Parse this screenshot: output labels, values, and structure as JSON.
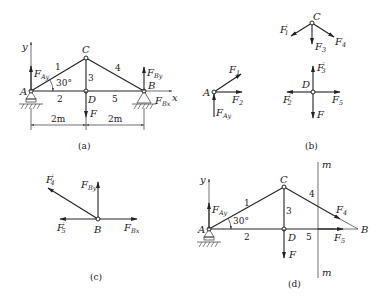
{
  "figure": {
    "panels": [
      {
        "id": "a",
        "caption": "(a)",
        "nodes": {
          "A": "A",
          "B": "B",
          "C": "C",
          "D": "D"
        },
        "members": [
          "1",
          "2",
          "3",
          "4",
          "5"
        ],
        "angle": "30°",
        "axes": {
          "x": "x",
          "y": "y"
        },
        "dimensions": [
          "2m",
          "2m"
        ],
        "forces": {
          "FAy_main": "F",
          "FAy_sub": "Ay",
          "FBy_main": "F",
          "FBy_sub": "By",
          "FBx_main": "F",
          "FBx_sub": "Bx",
          "F": "F"
        }
      },
      {
        "id": "b",
        "caption": "(b)",
        "node_C": {
          "label": "C",
          "forces": {
            "F1p_main": "F",
            "F1p_sub": "1",
            "F1p_prime": "′",
            "F3_main": "F",
            "F3_sub": "3",
            "F4_main": "F",
            "F4_sub": "4"
          }
        },
        "node_A": {
          "label": "A",
          "forces": {
            "F1_main": "F",
            "F1_sub": "1",
            "F2_main": "F",
            "F2_sub": "2",
            "FAy_main": "F",
            "FAy_sub": "Ay"
          }
        },
        "node_D": {
          "label": "D",
          "forces": {
            "F3p_main": "F",
            "F3p_sub": "3",
            "F3p_prime": "′",
            "F2p_main": "F",
            "F2p_sub": "2",
            "F2p_prime": "′",
            "F5_main": "F",
            "F5_sub": "5",
            "F": "F"
          }
        }
      },
      {
        "id": "c",
        "caption": "(c)",
        "node": "B",
        "forces": {
          "F4p_main": "F",
          "F4p_sub": "4",
          "F4p_prime": "′",
          "FBy_main": "F",
          "FBy_sub": "By",
          "F5p_main": "F",
          "F5p_sub": "5",
          "F5p_prime": "′",
          "FBx_main": "F",
          "FBx_sub": "Bx"
        }
      },
      {
        "id": "d",
        "caption": "(d)",
        "nodes": {
          "A": "A",
          "B": "B",
          "C": "C",
          "D": "D"
        },
        "members": [
          "1",
          "2",
          "3",
          "4",
          "5"
        ],
        "angle": "30°",
        "axes": {
          "y": "y"
        },
        "section_line": {
          "top": "m",
          "bottom": "m"
        },
        "forces": {
          "FAy_main": "F",
          "FAy_sub": "Ay",
          "F4_main": "F",
          "F4_sub": "4",
          "F5_main": "F",
          "F5_sub": "5",
          "F": "F"
        }
      }
    ]
  }
}
